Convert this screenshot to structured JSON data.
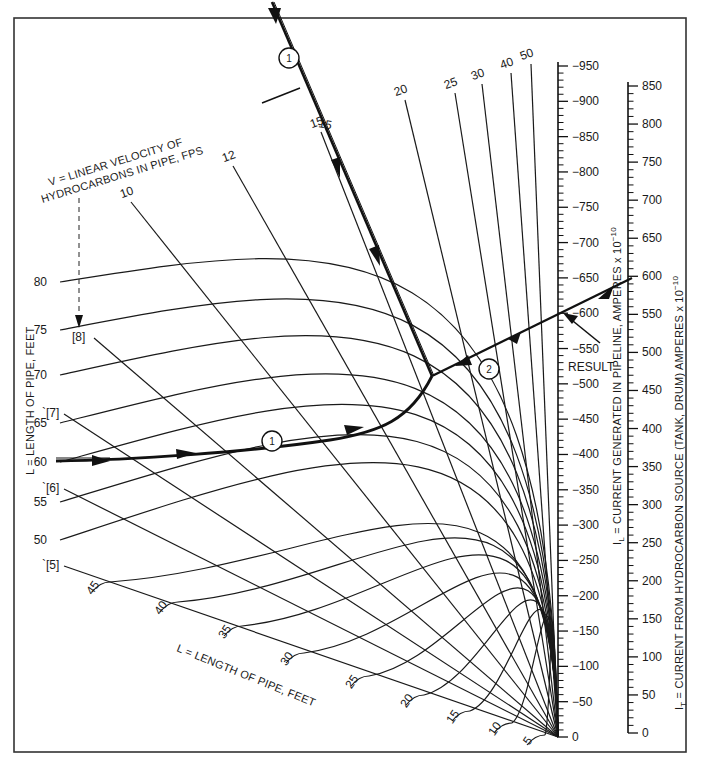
{
  "chart_data": {
    "type": "nomograph",
    "title": "",
    "frame": {
      "x": 14,
      "y": 18,
      "w": 672,
      "h": 734
    },
    "convergence_point": [
      558,
      737
    ],
    "length_curves": {
      "label": "L = LENGTH OF PIPE, FEET",
      "label_bottom": "L = LENGTH OF PIPE, FEET",
      "values": [
        80,
        75,
        70,
        65,
        60,
        55,
        50,
        45,
        40,
        35,
        30,
        25,
        20,
        15,
        10,
        5
      ],
      "left_labels": [
        {
          "v": "80",
          "x": 47,
          "y": 282
        },
        {
          "v": "75",
          "x": 47,
          "y": 330
        },
        {
          "v": "70",
          "x": 47,
          "y": 375
        },
        {
          "v": "65",
          "x": 47,
          "y": 423
        },
        {
          "v": "60",
          "x": 47,
          "y": 462
        },
        {
          "v": "55",
          "x": 47,
          "y": 502
        },
        {
          "v": "50",
          "x": 47,
          "y": 540
        }
      ],
      "diagonal_labels": [
        {
          "v": "45",
          "x": 96,
          "y": 590
        },
        {
          "v": "40",
          "x": 164,
          "y": 610
        },
        {
          "v": "35",
          "x": 228,
          "y": 634
        },
        {
          "v": "30",
          "x": 290,
          "y": 661
        },
        {
          "v": "25",
          "x": 355,
          "y": 684
        },
        {
          "v": "20",
          "x": 410,
          "y": 703
        },
        {
          "v": "15",
          "x": 456,
          "y": 719
        },
        {
          "v": "10",
          "x": 498,
          "y": 731
        },
        {
          "v": "5",
          "x": 531,
          "y": 743
        }
      ]
    },
    "velocity_lines": {
      "label_line1": "V = LINEAR VELOCITY OF",
      "label_line2": "HYDROCARBONS IN PIPE, FPS",
      "values": [
        5,
        6,
        7,
        8,
        10,
        12,
        15,
        20,
        25,
        30,
        40,
        50
      ],
      "labels": [
        {
          "v": "10",
          "x": 128,
          "y": 196
        },
        {
          "v": "12",
          "x": 230,
          "y": 160
        },
        {
          "v": "15",
          "x": 318,
          "y": 126
        },
        {
          "v": "20",
          "x": 402,
          "y": 94
        },
        {
          "v": "25",
          "x": 452,
          "y": 87
        },
        {
          "v": "30",
          "x": 479,
          "y": 78
        },
        {
          "v": "40",
          "x": 508,
          "y": 67
        },
        {
          "v": "50",
          "x": 528,
          "y": 58
        }
      ],
      "bracket_labels": [
        {
          "v": "[8]",
          "x": 72,
          "y": 341
        },
        {
          "v": "`[7]",
          "x": 42,
          "y": 417
        },
        {
          "v": "`[6]",
          "x": 42,
          "y": 492
        },
        {
          "v": "`[5]",
          "x": 42,
          "y": 569
        }
      ]
    },
    "scale_IL": {
      "label": "I",
      "subscript": "L",
      "label_rest": " = CURRENT GENERATED IN PIPELINE, AMPERES x 10",
      "exponent": "−10",
      "min": 0,
      "max": 950,
      "major_step": 50,
      "tick_labels": [
        "0",
        "50",
        "100",
        "150",
        "200",
        "250",
        "300",
        "350",
        "400",
        "450",
        "500",
        "550",
        "600",
        "650",
        "700",
        "750",
        "800",
        "850",
        "900",
        "950"
      ],
      "x": 558,
      "y0": 737,
      "y_top": 66
    },
    "scale_IT": {
      "label": "I",
      "subscript": "T",
      "label_rest": " = CURRENT FROM HYDROCARBON SOURCE  (TANK, DRUM)  AMPERES x 10",
      "exponent": "−10",
      "min": 0,
      "max": 850,
      "major_step": 50,
      "tick_labels": [
        "0",
        "50",
        "100",
        "150",
        "200",
        "250",
        "300",
        "350",
        "400",
        "450",
        "500",
        "550",
        "600",
        "650",
        "700",
        "750",
        "800",
        "850"
      ],
      "x": 628,
      "y0": 733,
      "y_top": 86
    },
    "example": {
      "step_markers": [
        "1",
        "1",
        "2"
      ],
      "inputs": {
        "L_feet": 60,
        "V_fps": 15,
        "I_T": 600
      },
      "result_label": "RESULT",
      "result_I_L": 540
    }
  }
}
